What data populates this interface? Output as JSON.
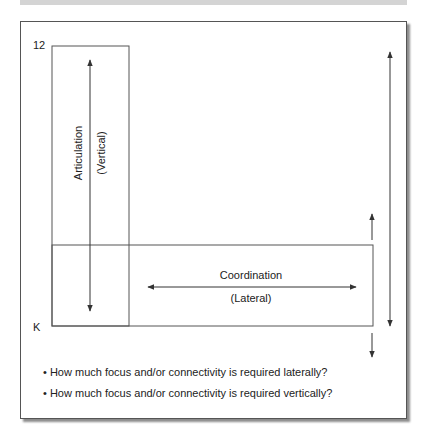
{
  "diagram": {
    "scale_top_label": "12",
    "scale_bottom_label": "K",
    "vertical_box": {
      "label": "Articulation",
      "sublabel": "(Vertical)"
    },
    "horizontal_box": {
      "label": "Coordination",
      "sublabel": "(Lateral)"
    },
    "questions": [
      "• How much focus and/or connectivity is required laterally?",
      "• How much focus and/or connectivity is required vertically?"
    ],
    "colors": {
      "line": "#555555",
      "text": "#222222",
      "topbar": "#d4d4d4"
    }
  }
}
